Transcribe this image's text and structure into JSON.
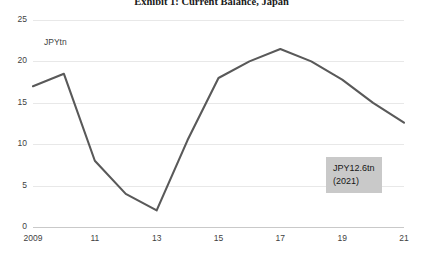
{
  "chart_data": {
    "type": "line",
    "title": "Exhibit 1:  Current Balance, Japan",
    "xlabel": "",
    "ylabel": "",
    "unit_label": "JPYtn",
    "grid": true,
    "legend": "none",
    "xlim": [
      2009,
      2021
    ],
    "ylim": [
      0,
      25
    ],
    "yticks": [
      0,
      5,
      10,
      15,
      20,
      25
    ],
    "ytick_labels": [
      "0",
      "5",
      "10",
      "15",
      "20",
      "25"
    ],
    "xticks": [
      2009,
      2011,
      2013,
      2015,
      2017,
      2019,
      2021
    ],
    "xtick_labels": [
      "2009",
      "11",
      "13",
      "15",
      "17",
      "19",
      "21"
    ],
    "x": [
      2009,
      2010,
      2011,
      2012,
      2013,
      2014,
      2015,
      2016,
      2017,
      2018,
      2019,
      2020,
      2021
    ],
    "values": [
      17.0,
      18.5,
      8.0,
      4.0,
      2.0,
      10.5,
      18.0,
      20.0,
      21.5,
      20.0,
      17.8,
      15.0,
      12.6
    ],
    "series": [
      {
        "name": "Current Balance",
        "color": "#595959",
        "values": [
          17.0,
          18.5,
          8.0,
          4.0,
          2.0,
          10.5,
          18.0,
          20.0,
          21.5,
          20.0,
          17.8,
          15.0,
          12.6
        ]
      }
    ],
    "annotations": [
      {
        "name": "latest-value-callout",
        "line1": "JPY12.6tn",
        "line2": "(2021)",
        "value": 12.6,
        "year": 2021,
        "background": "#c9c9c9"
      }
    ],
    "colors": {
      "line": "#595959",
      "gridline": "#e8e8e8",
      "axis": "#c9c9c9",
      "text": "#3f3f3f",
      "background": "#ffffff"
    }
  }
}
